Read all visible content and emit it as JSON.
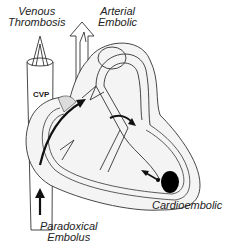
{
  "diagram": {
    "labels": {
      "venous": [
        "Venous",
        "Thrombosis"
      ],
      "arterial": [
        "Arterial",
        "Embolic"
      ],
      "cvp": "CVP",
      "paradoxical": [
        "Paradoxical",
        "Embolus"
      ],
      "cardioembolic": "Cardioembolic"
    },
    "colors": {
      "stroke": "#333333",
      "fill_gray": "#dcdcdc",
      "arrow": "#111111"
    }
  }
}
